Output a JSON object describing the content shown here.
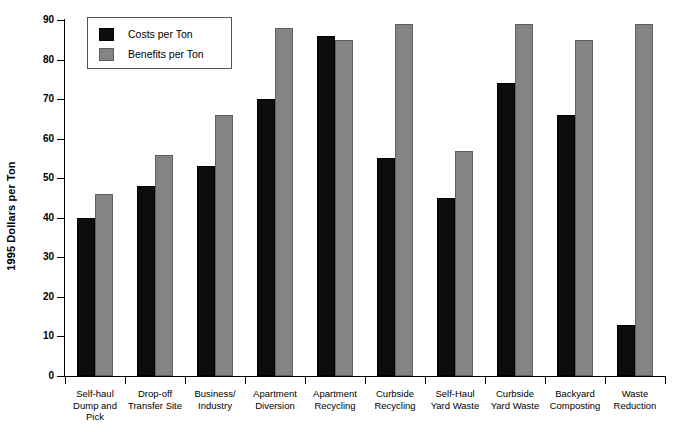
{
  "chart_data": {
    "type": "bar",
    "title": "",
    "subtitle": "",
    "xlabel": "",
    "ylabel": "1995 Dollars per Ton",
    "ylim": [
      0,
      90
    ],
    "ytick_step": 10,
    "yticks": [
      90,
      80,
      70,
      60,
      50,
      40,
      30,
      20,
      10,
      0
    ],
    "grid": false,
    "legend_position": "top-left",
    "categories": [
      "Self-haul Dump and Pick",
      "Drop-off Transfer Site",
      "Business/ Industry",
      "Apartment Diversion",
      "Apartment Recycling",
      "Curbside Recycling",
      "Self-Haul Yard Waste",
      "Curbside Yard Waste",
      "Backyard Composting",
      "Waste Reduction"
    ],
    "category_label_lines": [
      [
        "Self-haul",
        "Dump and",
        "Pick"
      ],
      [
        "Drop-off",
        "Transfer Site"
      ],
      [
        "Business/",
        "Industry"
      ],
      [
        "Apartment",
        "Diversion"
      ],
      [
        "Apartment",
        "Recycling"
      ],
      [
        "Curbside",
        "Recycling"
      ],
      [
        "Self-Haul",
        "Yard Waste"
      ],
      [
        "Curbside",
        "Yard Waste"
      ],
      [
        "Backyard",
        "Composting"
      ],
      [
        "Waste",
        "Reduction"
      ]
    ],
    "series": [
      {
        "name": "Costs per Ton",
        "color": "#0d0d0d",
        "values": [
          40,
          48,
          53,
          70,
          86,
          55,
          45,
          74,
          66,
          13
        ]
      },
      {
        "name": "Benefits per Ton",
        "color": "#848484",
        "values": [
          46,
          56,
          66,
          88,
          85,
          89,
          57,
          89,
          85,
          89
        ]
      }
    ]
  },
  "legend": {
    "entries": [
      {
        "label": "Costs per Ton"
      },
      {
        "label": "Benefits per Ton"
      }
    ]
  }
}
